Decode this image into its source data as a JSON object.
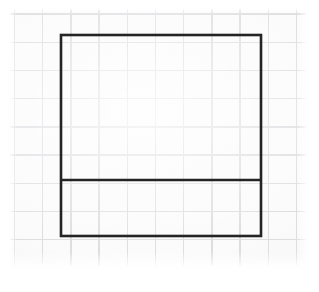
{
  "scene": {
    "title": "Graph paper with drawn rectangle divided by a horizontal line",
    "canvas": {
      "width": 319,
      "height": 292,
      "background": "#ffffff"
    }
  },
  "paper": {
    "label": "graph paper sheet",
    "x": 10,
    "y": 9,
    "width": 296,
    "height": 257,
    "color": "#fbfbfb"
  },
  "grid": {
    "label": "printed square grid ruling",
    "spacing": 28.2,
    "origin_x": 4.5,
    "origin_y": 5.0,
    "line_color": "#dedee1",
    "line_width": 1.4,
    "columns": 11,
    "rows": 10
  },
  "figure": {
    "label": "drawn figure",
    "stroke_color": "#242424",
    "stroke_width": 2.6,
    "shapes": [
      {
        "name": "outer-rectangle",
        "type": "rectangle",
        "left": 61,
        "top": 35,
        "right": 261,
        "bottom": 236,
        "width": 200,
        "height": 201
      },
      {
        "name": "horizontal-divider",
        "type": "line",
        "x1": 61,
        "y1": 180,
        "x2": 261,
        "y2": 180,
        "length": 200
      }
    ],
    "regions": [
      {
        "name": "upper-region",
        "height": 145
      },
      {
        "name": "lower-region",
        "height": 56
      }
    ]
  }
}
